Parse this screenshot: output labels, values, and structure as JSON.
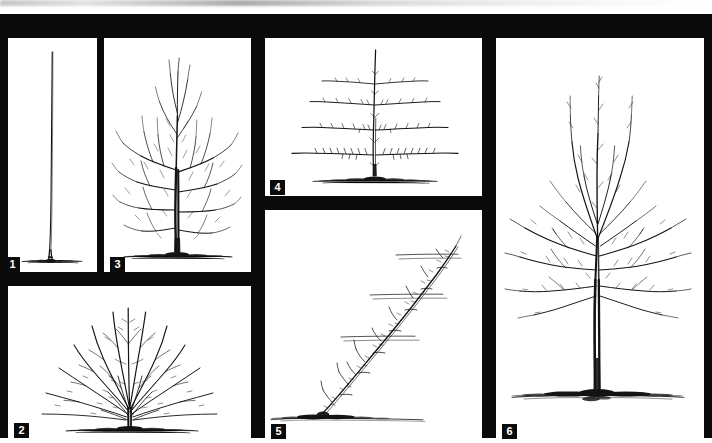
{
  "figure": {
    "panel_count": 6,
    "style": "black-and-white pen line drawing",
    "frame_color": "#0a0a0a",
    "panel_background": "#ffffff",
    "badge_background": "#0b0b0b",
    "badge_text_color": "#ffffff"
  },
  "panels": [
    {
      "number": "1",
      "name": "whip-unbranched-maiden",
      "subject": "Single unbranched whip / maiden stem with soil line at base",
      "form": "whip",
      "branch_count": 0,
      "has_soil_line": true
    },
    {
      "number": "2",
      "name": "vase-fan-form",
      "subject": "Vase or fan shaped tree with many branches radiating from a short trunk",
      "form": "vase",
      "branch_count": 18,
      "has_soil_line": true
    },
    {
      "number": "3",
      "name": "dense-branched-tree",
      "subject": "Densely branched young tree with short trunk and full twiggy crown",
      "form": "bush",
      "branch_count": 14,
      "has_soil_line": true
    },
    {
      "number": "4",
      "name": "horizontal-espalier",
      "subject": "Horizontal espalier with central leader and four tiers of horizontal arms",
      "form": "espalier",
      "tier_count": 4,
      "has_soil_line": true
    },
    {
      "number": "5",
      "name": "oblique-cordon",
      "subject": "Oblique single cordon trained at an angle across three horizontal support wires",
      "form": "cordon",
      "wire_count": 3,
      "has_soil_line": true
    },
    {
      "number": "6",
      "name": "central-leader-standard",
      "subject": "Tall standard tree with clear trunk and open spreading branched crown",
      "form": "central-leader",
      "branch_count": 16,
      "has_soil_line": true
    }
  ]
}
